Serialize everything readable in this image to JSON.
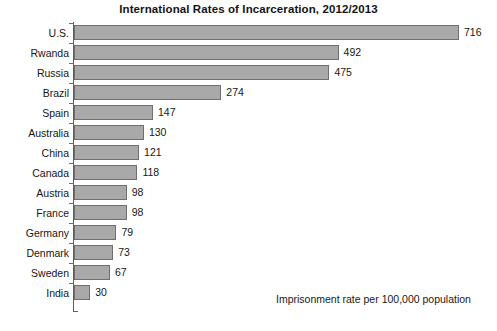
{
  "chart_data": {
    "type": "bar",
    "orientation": "horizontal",
    "title": "International Rates of Incarceration, 2012/2013",
    "xlabel": "",
    "ylabel": "",
    "categories": [
      "U.S.",
      "Rwanda",
      "Russia",
      "Brazil",
      "Spain",
      "Australia",
      "China",
      "Canada",
      "Austria",
      "France",
      "Germany",
      "Denmark",
      "Sweden",
      "India"
    ],
    "values": [
      716,
      492,
      475,
      274,
      147,
      130,
      121,
      118,
      98,
      98,
      79,
      73,
      67,
      30
    ],
    "value_labels": [
      "716",
      "492",
      "475",
      "274",
      "147",
      "130",
      "121",
      "118",
      "98",
      "98",
      "79",
      "73",
      "67",
      "30"
    ],
    "xlim": [
      0,
      716
    ],
    "grid": false,
    "legend": null,
    "annotation": "Imprisonment rate per 100,000 population",
    "bar_color": "#a9a9a9",
    "bar_border_color": "#6f6f6f",
    "axis_color": "#5d5d5d",
    "text_color": "#161616",
    "background": "#ffffff"
  },
  "footnote": {
    "text": "Imprisonment rate per 100,000 population"
  }
}
